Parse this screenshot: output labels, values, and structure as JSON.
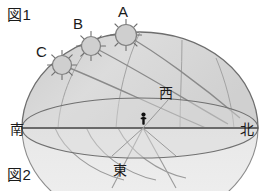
{
  "figure": {
    "top_label": "図1",
    "bottom_label": "図2"
  },
  "suns": [
    {
      "id": "A",
      "label": "A",
      "label_x": 118,
      "label_y": 4,
      "cx": 126,
      "cy": 35,
      "r": 10.5
    },
    {
      "id": "B",
      "label": "B",
      "label_x": 73,
      "label_y": 16,
      "cx": 91,
      "cy": 46,
      "r": 9.5
    },
    {
      "id": "C",
      "label": "C",
      "label_x": 36,
      "label_y": 44,
      "cx": 62,
      "cy": 65,
      "r": 9.5
    }
  ],
  "directions": [
    {
      "name": "south",
      "label": "南",
      "x": 10,
      "y": 122
    },
    {
      "name": "north",
      "label": "北",
      "x": 240,
      "y": 122
    },
    {
      "name": "west",
      "label": "西",
      "x": 159,
      "y": 86
    },
    {
      "name": "east",
      "label": "東",
      "x": 113,
      "y": 163
    }
  ],
  "observer": {
    "name": "observer-figure",
    "x": 143,
    "y": 123
  },
  "colors": {
    "dome_fill": "#d4d4d4",
    "dome_fill_light": "#e4e4e4",
    "below_horizon_fill": "#ececec",
    "outline": "#6e6e6e",
    "arc_line": "#8a8a8a",
    "horizon_line": "#5a5a5a",
    "sun_fill": "#cfcfcf",
    "sun_stroke": "#8a8a8a",
    "ray": "#7a7a7a",
    "text": "#1a1a1a",
    "background": "#ffffff"
  },
  "geometry": {
    "dome_center_x": 140,
    "dome_center_y": 128,
    "dome_radius_x": 118,
    "dome_radius_y": 96,
    "horizon_ellipse_ry": 30,
    "horizon_line_y": 128,
    "horizon_left_x": 22,
    "horizon_right_x": 258
  }
}
